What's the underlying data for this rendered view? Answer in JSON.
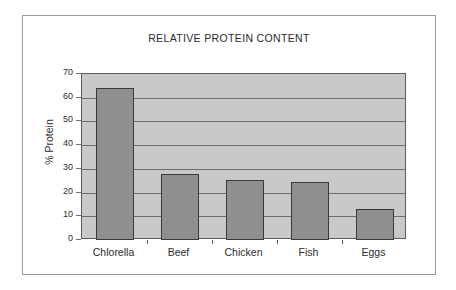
{
  "chart_data": {
    "type": "bar",
    "title": "RELATIVE PROTEIN CONTENT",
    "xlabel": "",
    "ylabel": "% Protein",
    "categories": [
      "Chlorella",
      "Beef",
      "Chicken",
      "Fish",
      "Eggs"
    ],
    "values": [
      64,
      28,
      25.5,
      24.5,
      13
    ],
    "ylim": [
      0,
      70
    ],
    "ytick_labels": [
      "70",
      "60",
      "50",
      "40",
      "30",
      "20",
      "10",
      "0"
    ],
    "ytick_values": [
      70,
      60,
      50,
      40,
      30,
      20,
      10,
      0
    ],
    "ytick_step": 10,
    "grid": true,
    "legend": false,
    "legend_position": "none",
    "colors": {
      "bar_fill": "#8f8f8f",
      "bar_edge": "#3a3a3a",
      "plot_background": "#c9c9c9",
      "gridline": "#6e6e6e",
      "axis": "#5c5c5c",
      "frame": "#9a9a9a",
      "text": "#2b2b2b",
      "figure_background": "#ffffff"
    }
  }
}
